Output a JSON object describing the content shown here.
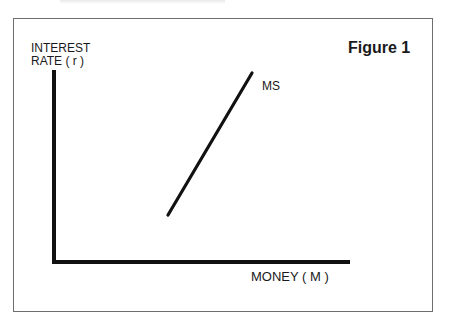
{
  "figure": {
    "title": "Figure 1",
    "y_axis_label_line1": "INTEREST",
    "y_axis_label_line2": "RATE ( r )",
    "x_axis_label": "MONEY ( M )",
    "curve_label": "MS"
  },
  "colors": {
    "ink": "#111111",
    "frame": "#6e6e6e",
    "background": "#ffffff"
  },
  "geometry": {
    "origin": [
      54,
      262
    ],
    "y_axis_top": [
      54,
      70
    ],
    "x_axis_end": [
      350,
      262
    ],
    "ms_line": {
      "from": [
        168,
        215
      ],
      "to": [
        252,
        73
      ]
    }
  }
}
